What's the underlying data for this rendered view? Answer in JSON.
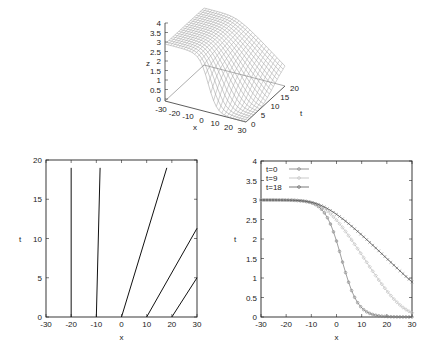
{
  "chart_data": [
    {
      "type": "surface3d",
      "title": "",
      "xlabel": "x",
      "ylabel": "t",
      "zlabel": "z",
      "xlim": [
        -30,
        30
      ],
      "ylim": [
        0,
        20
      ],
      "zlim": [
        0,
        4
      ],
      "x_ticks": [
        "-30",
        "-20",
        "-10",
        "0",
        "10",
        "20",
        "30"
      ],
      "t_ticks": [
        "0",
        "5",
        "10",
        "15",
        "20"
      ],
      "z_ticks": [
        "0",
        "0.5",
        "1",
        "1.5",
        "2",
        "2.5",
        "3",
        "3.5",
        "4"
      ],
      "description": "Mesh surface z(x,t): plateau z=3 for x<0 decaying to z=0 for x>20; front spreads as t increases"
    },
    {
      "type": "line",
      "title": "",
      "xlabel": "x",
      "ylabel": "t",
      "xlim": [
        -30,
        30
      ],
      "ylim": [
        0,
        20
      ],
      "x_ticks": [
        "-30",
        "-20",
        "-10",
        "0",
        "10",
        "20",
        "30"
      ],
      "y_ticks": [
        "0",
        "5",
        "10",
        "15",
        "20"
      ],
      "series": [
        {
          "name": "characteristic x0=-20",
          "x": [
            -20,
            -20
          ],
          "y": [
            0,
            19
          ]
        },
        {
          "name": "characteristic x0=-10",
          "x": [
            -10,
            -8.5
          ],
          "y": [
            0,
            19
          ]
        },
        {
          "name": "characteristic x0=0",
          "x": [
            0,
            18
          ],
          "y": [
            0,
            19
          ]
        },
        {
          "name": "characteristic x0=10",
          "x": [
            10,
            30
          ],
          "y": [
            0,
            11.3
          ]
        },
        {
          "name": "characteristic x0=20",
          "x": [
            20,
            30
          ],
          "y": [
            0,
            5
          ]
        }
      ]
    },
    {
      "type": "line",
      "title": "",
      "xlabel": "x",
      "ylabel": "t",
      "xlim": [
        -30,
        30
      ],
      "ylim": [
        0,
        4
      ],
      "x_ticks": [
        "-30",
        "-20",
        "-10",
        "0",
        "10",
        "20",
        "30"
      ],
      "y_ticks": [
        "0",
        "0.5",
        "1",
        "1.5",
        "2",
        "2.5",
        "3",
        "3.5",
        "4"
      ],
      "legend_position": "upper-left",
      "series": [
        {
          "name": "t=0",
          "marker": "circle",
          "color": "#777777",
          "x": [
            -30,
            -25,
            -20,
            -15,
            -10,
            -5,
            0,
            5,
            10,
            15,
            20,
            25,
            30
          ],
          "y": [
            3.0,
            3.0,
            2.99,
            2.98,
            2.93,
            2.74,
            2.07,
            1.06,
            0.32,
            0.06,
            0.01,
            0.0,
            0.0
          ]
        },
        {
          "name": "t=9",
          "marker": "diamond",
          "color": "#bbbbbb",
          "x": [
            -30,
            -25,
            -20,
            -15,
            -10,
            -5,
            0,
            5,
            10,
            15,
            20,
            25,
            30
          ],
          "y": [
            3.0,
            3.0,
            2.99,
            2.96,
            2.88,
            2.68,
            2.32,
            1.85,
            1.35,
            0.92,
            0.58,
            0.36,
            0.24
          ]
        },
        {
          "name": "t=18",
          "marker": "cross",
          "color": "#555555",
          "x": [
            -30,
            -25,
            -20,
            -15,
            -10,
            -5,
            0,
            5,
            10,
            15,
            20,
            25,
            30
          ],
          "y": [
            3.0,
            2.99,
            2.98,
            2.93,
            2.83,
            2.64,
            2.38,
            2.08,
            1.78,
            1.5,
            1.26,
            1.08,
            0.93
          ]
        }
      ]
    }
  ],
  "model": {
    "plateau": 3,
    "center": 2,
    "width": 6.5,
    "speed_max": 2,
    "speed_slope": 0.6667
  }
}
